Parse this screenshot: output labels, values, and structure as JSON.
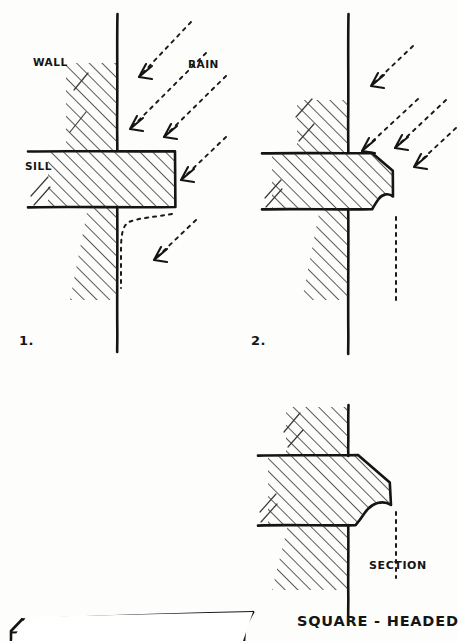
{
  "sheet": {
    "kind": "hand-drawn architectural detail sheet",
    "background_color": "#fdfdfc",
    "ink_color": "#141414",
    "width": 458,
    "height": 641
  },
  "figures": [
    {
      "id": "fig-1",
      "number_label": "1.",
      "caption": "Plain square sill — rain tracks back underneath",
      "labels": {
        "wall": "WALL",
        "rain": "RAIN",
        "sill": "SILL"
      },
      "rain_arrow_count": 4,
      "has_drip_groove": false
    },
    {
      "id": "fig-2",
      "number_label": "2.",
      "caption": "Weathered sill with throating / drip — rain falls clear",
      "rain_arrow_count": 4,
      "has_drip_groove": true
    },
    {
      "id": "fig-3",
      "number_label": "",
      "caption": "Enlarged profile of the weathered sill",
      "labels": {
        "section": "SECTION"
      },
      "rain_arrow_count": 0,
      "has_drip_groove": true
    }
  ],
  "title": {
    "main": "SQUARE - HEADED"
  }
}
